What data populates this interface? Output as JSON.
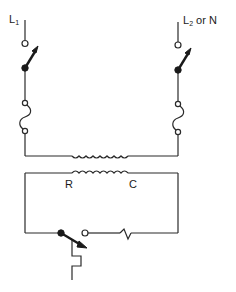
{
  "diagram": {
    "type": "circuit-schematic",
    "labels": {
      "line1": {
        "main": "L",
        "sub": "1"
      },
      "line2": {
        "main": "L",
        "sub": "2",
        "suffix": " or N"
      },
      "coil_r": "R",
      "coil_c": "C"
    },
    "components": [
      {
        "name": "line1-disconnect-switch",
        "kind": "switch"
      },
      {
        "name": "line2-disconnect-switch",
        "kind": "switch"
      },
      {
        "name": "line1-fuse",
        "kind": "fuse"
      },
      {
        "name": "line2-fuse",
        "kind": "fuse"
      },
      {
        "name": "transformer-primary-coil",
        "kind": "inductor"
      },
      {
        "name": "transformer-secondary-coil",
        "kind": "inductor"
      },
      {
        "name": "thermostat-switch",
        "kind": "switch"
      },
      {
        "name": "control-resistor",
        "kind": "resistor"
      },
      {
        "name": "thermal-element",
        "kind": "bimetal"
      }
    ],
    "colors": {
      "line": "#2a2a2a",
      "background": "#ffffff"
    }
  }
}
